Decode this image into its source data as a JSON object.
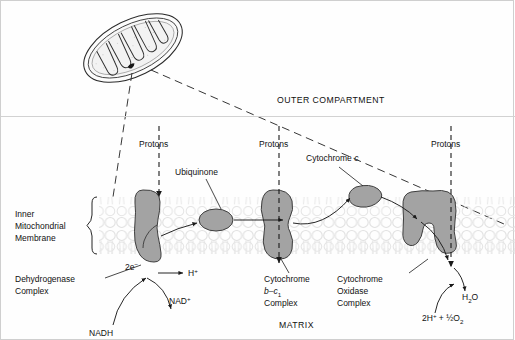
{
  "figure": {
    "colors": {
      "complex_fill": "#a3a3a3",
      "complex_stroke": "#3a3a3a",
      "membrane": "#e2e2e2",
      "line": "#1a1a1a",
      "divider": "#d0d0d0",
      "background": "#fefefe"
    }
  },
  "compartments": {
    "outer": "OUTER COMPARTMENT",
    "matrix": "MATRIX",
    "membrane_label": [
      "Inner",
      "Mitochondrial",
      "Membrane"
    ]
  },
  "proton_labels": [
    {
      "text": "Protons"
    },
    {
      "text": "Protons"
    },
    {
      "text": "Protons"
    }
  ],
  "complexes": [
    {
      "name": "dehydrogenase",
      "label_lines": [
        "Dehydrogenase",
        "Complex"
      ]
    },
    {
      "name": "cytochrome-b-c1",
      "label_lines": [
        "Cytochrome",
        "b–c",
        "Complex"
      ],
      "subscript": "1"
    },
    {
      "name": "cytochrome-oxidase",
      "label_lines": [
        "Cytochrome",
        "Oxidase",
        "Complex"
      ]
    }
  ],
  "carriers": [
    {
      "name": "ubiquinone",
      "label": "Ubiquinone"
    },
    {
      "name": "cytochrome-c",
      "label_prefix": "Cytochrome ",
      "label_italic": "c"
    }
  ],
  "molecules": {
    "nadh": "NADH",
    "nad_plus_base": "NAD",
    "nad_plus_sup": "+",
    "electrons_base": "2e",
    "electrons_sup": "−",
    "proton_base": "H",
    "proton_sup": "+",
    "water_base": "H",
    "water_sub": "2",
    "water_tail": "O",
    "substrate_base": "2H",
    "substrate_sup": "+",
    "substrate_mid": " + ½O",
    "substrate_sub": "2"
  }
}
